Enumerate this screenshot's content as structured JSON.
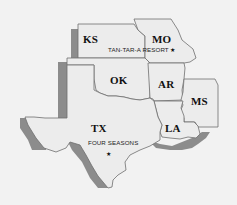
{
  "map": {
    "title": "South-Central US resort map",
    "colors": {
      "background": "#f2f2f2",
      "state_fill": "#ececec",
      "state_border": "#6e6e6e",
      "shadow": "#8c8c8c",
      "text": "#111111"
    },
    "states": [
      {
        "id": "KS",
        "label": "KS"
      },
      {
        "id": "MO",
        "label": "MO"
      },
      {
        "id": "OK",
        "label": "OK"
      },
      {
        "id": "AR",
        "label": "AR"
      },
      {
        "id": "MS",
        "label": "MS"
      },
      {
        "id": "TX",
        "label": "TX"
      },
      {
        "id": "LA",
        "label": "LA"
      }
    ],
    "points_of_interest": [
      {
        "name": "TAN-TAR-A RESORT",
        "state": "MO",
        "marker": "★"
      },
      {
        "name": "FOUR SEASONS",
        "state": "TX",
        "marker": "★"
      }
    ]
  }
}
